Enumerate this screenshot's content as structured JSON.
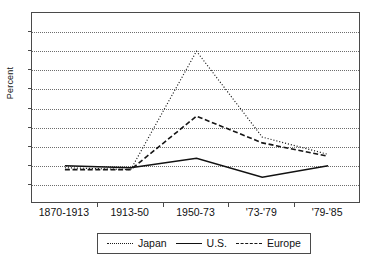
{
  "chart_data": {
    "type": "line",
    "title": "",
    "xlabel": "",
    "ylabel": "Percent",
    "categories": [
      "1870-1913",
      "1913-50",
      "1950-73",
      "'73-'79",
      "'79-'85"
    ],
    "ylim": [
      0,
      10
    ],
    "ytick_labels": [
      "0",
      "1",
      "2",
      "3",
      "4",
      "5",
      "6",
      "7",
      "8",
      "9",
      "10"
    ],
    "ytick_values": [
      0,
      1,
      2,
      3,
      4,
      5,
      6,
      7,
      8,
      9,
      10
    ],
    "grid": "horizontal-dotted",
    "legend_position": "bottom-outside",
    "series": [
      {
        "name": "Japan",
        "style": "dotted",
        "color": "#1c1c1c",
        "values": [
          1.9,
          1.8,
          8.0,
          3.5,
          2.6
        ]
      },
      {
        "name": "U.S.",
        "style": "solid",
        "color": "#111111",
        "values": [
          2.0,
          1.9,
          2.4,
          1.4,
          2.0
        ]
      },
      {
        "name": "Europe",
        "style": "dashed",
        "color": "#151515",
        "values": [
          1.8,
          1.8,
          4.6,
          3.2,
          2.5
        ]
      }
    ]
  },
  "legend": {
    "items": [
      {
        "label": "Japan"
      },
      {
        "label": "U.S."
      },
      {
        "label": "Europe"
      }
    ]
  }
}
